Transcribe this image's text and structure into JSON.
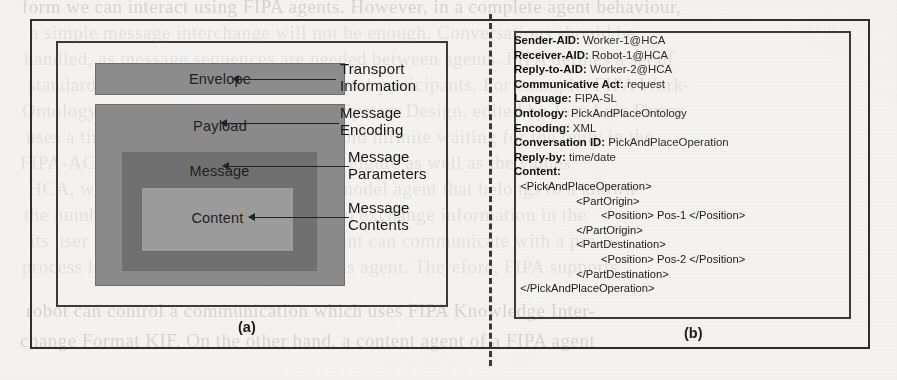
{
  "figure": {
    "panel_a_caption": "(a)",
    "panel_b_caption": "(b)"
  },
  "panel_a": {
    "title": "FIPA message structure",
    "boxes": [
      {
        "label": "Envelope",
        "color": "#8c8c8c"
      },
      {
        "label": "Payload",
        "color": "#8a8a8a"
      },
      {
        "label": "Message",
        "color": "#707070"
      },
      {
        "label": "Content",
        "color": "#9b9b9b"
      }
    ],
    "callouts": [
      {
        "line1": "Transport",
        "line2": "Information"
      },
      {
        "line1": "Message",
        "line2": "Encoding"
      },
      {
        "line1": "Message",
        "line2": "Parameters"
      },
      {
        "line1": "Message",
        "line2": "Contents"
      }
    ]
  },
  "panel_b": {
    "fields": [
      {
        "key": "Sender-AID:",
        "value": " Worker-1@HCA"
      },
      {
        "key": "Receiver-AID:",
        "value": " Robot-1@HCA"
      },
      {
        "key": "Reply-to-AID:",
        "value": " Worker-2@HCA"
      },
      {
        "key": "Communicative Act:",
        "value": " request"
      },
      {
        "key": "Language:",
        "value": " FIPA-SL"
      },
      {
        "key": "Ontology:",
        "value": " PickAndPlaceOntology"
      },
      {
        "key": "Encoding:",
        "value": " XML"
      },
      {
        "key": "Conversation ID:",
        "value": " PickAndPlaceOperation"
      },
      {
        "key": "Reply-by:",
        "value": " time/date"
      },
      {
        "key": "Content:",
        "value": ""
      }
    ],
    "content_xml": [
      "  <PickAndPlaceOperation>",
      "                    <PartOrigin>",
      "                            <Position> Pos-1 </Position>",
      "                    </PartOrigin>",
      "                    <PartDestination>",
      "                            <Position> Pos-2 </Position>",
      "                    </PartDestination>",
      "  </PickAndPlaceOperation>"
    ]
  },
  "background_text": {
    "lines": [
      "form we can interact using FIPA agents. However, in a complete agent behaviour,",
      "a simple message interchange will not be enough. Conversations should be",
      "handled, as message sequences are needed between agents. FIPA defines a set of",
      "standard interaction protocols with several participants. For example, FIPA Work-",
      "Ontology Engineering and Multi-agent System Design, edited by Jose Luis Ferrer",
      "uses a timeout procedure in order to avoid infinite waiting for the reply in the",
      "FIPA-ACL Message structure, shown in Figure as well as the values",
      "HCA, which AID is used to identify a model agent that belongs to a known",
      "the number of the required parameters to exchange information in the",
      "its user is a required concept, so an agent can communicate with a pre-",
      "process language used by an autonomous agent. Therefore, FIPA supports",
      "robot can control a communication which uses FIPA Knowledge Inter-",
      "change Format KIF. On the other hand, a content agent of a FIPA agent"
    ]
  }
}
